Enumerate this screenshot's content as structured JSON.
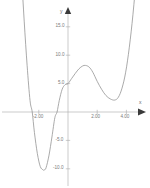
{
  "figure": {
    "top_caption": "",
    "axis_names": {
      "x": "x",
      "y": "y"
    }
  },
  "chart_data": {
    "type": "line",
    "title": "",
    "subtitle": "",
    "xlabel": "x",
    "ylabel": "y",
    "grid": false,
    "legend": null,
    "xlim": [
      -3.6,
      5.2
    ],
    "ylim": [
      -13.5,
      17.0
    ],
    "xticks": [
      -2.0,
      2.0,
      4.0
    ],
    "xtick_labels": [
      "-2.00",
      "2.00",
      "4.00"
    ],
    "yticks": [
      15.0,
      10.0,
      5.0,
      -5.0,
      -10.0
    ],
    "ytick_labels": [
      "15.0",
      "10.0",
      "5.0",
      "-5.0",
      "-10.0"
    ],
    "y_intercept": 5.0,
    "x_roots": [
      -2.45,
      -0.75,
      null,
      null
    ],
    "local_minima": [
      {
        "x": -1.62,
        "y": -10.2
      },
      {
        "x": 3.2,
        "y": 2.1
      }
    ],
    "local_maxima": [
      {
        "x": 1.2,
        "y": 8.2
      }
    ],
    "series": [
      {
        "name": "curve",
        "color": "#8d8d8d",
        "x": [
          -3.4,
          -3.2,
          -3.0,
          -2.8,
          -2.6,
          -2.45,
          -2.3,
          -2.1,
          -1.9,
          -1.7,
          -1.62,
          -1.5,
          -1.3,
          -1.1,
          -0.9,
          -0.75,
          -0.6,
          -0.4,
          -0.2,
          0.0,
          0.25,
          0.5,
          0.75,
          1.0,
          1.2,
          1.45,
          1.7,
          2.0,
          2.3,
          2.6,
          2.9,
          3.2,
          3.45,
          3.7,
          3.95,
          4.2,
          4.45,
          4.7,
          4.95
        ],
        "y": [
          36.0,
          25.0,
          16.0,
          8.2,
          2.0,
          0.0,
          -3.6,
          -7.3,
          -9.6,
          -10.2,
          -10.2,
          -9.8,
          -7.6,
          -4.4,
          -1.0,
          0.0,
          2.0,
          4.0,
          4.8,
          5.0,
          5.9,
          6.8,
          7.6,
          8.1,
          8.2,
          7.9,
          7.0,
          5.4,
          4.0,
          2.9,
          2.3,
          2.1,
          2.6,
          4.2,
          7.0,
          11.4,
          17.2,
          24.6,
          33.8
        ]
      }
    ]
  }
}
